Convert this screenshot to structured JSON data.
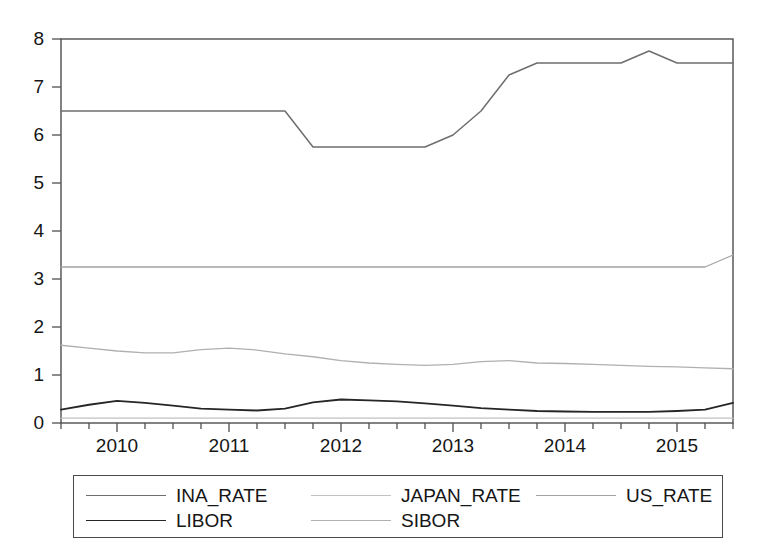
{
  "chart_data": {
    "type": "line",
    "title": "",
    "xlabel": "",
    "ylabel": "",
    "ylim": [
      0,
      8
    ],
    "yticks": [
      0,
      1,
      2,
      3,
      4,
      5,
      6,
      7,
      8
    ],
    "xticks": [
      "2010",
      "2011",
      "2012",
      "2013",
      "2014",
      "2015"
    ],
    "x_minor_ticks_per_year": 4,
    "grid": false,
    "legend_position": "bottom",
    "x_range_start": 2009.5,
    "x_range_end": 2015.5,
    "x": [
      2009.5,
      2009.75,
      2010.0,
      2010.25,
      2010.5,
      2010.75,
      2011.0,
      2011.25,
      2011.5,
      2011.75,
      2012.0,
      2012.25,
      2012.5,
      2012.75,
      2013.0,
      2013.25,
      2013.5,
      2013.75,
      2014.0,
      2014.25,
      2014.5,
      2014.75,
      2015.0,
      2015.25,
      2015.5
    ],
    "series": [
      {
        "name": "INA_RATE",
        "color": "#6e6e6e",
        "width": 1.5,
        "values": [
          6.5,
          6.5,
          6.5,
          6.5,
          6.5,
          6.5,
          6.5,
          6.5,
          6.5,
          5.75,
          5.75,
          5.75,
          5.75,
          5.75,
          6.0,
          6.5,
          7.25,
          7.5,
          7.5,
          7.5,
          7.5,
          7.75,
          7.5,
          7.5,
          7.5
        ]
      },
      {
        "name": "JAPAN_RATE",
        "color": "#c2c2c2",
        "width": 1.2,
        "values": [
          0.1,
          0.1,
          0.1,
          0.1,
          0.1,
          0.1,
          0.1,
          0.1,
          0.1,
          0.1,
          0.1,
          0.1,
          0.1,
          0.1,
          0.1,
          0.1,
          0.1,
          0.1,
          0.1,
          0.1,
          0.1,
          0.1,
          0.1,
          0.1,
          0.1
        ]
      },
      {
        "name": "US_RATE",
        "color": "#a3a3a3",
        "width": 1.3,
        "values": [
          3.25,
          3.25,
          3.25,
          3.25,
          3.25,
          3.25,
          3.25,
          3.25,
          3.25,
          3.25,
          3.25,
          3.25,
          3.25,
          3.25,
          3.25,
          3.25,
          3.25,
          3.25,
          3.25,
          3.25,
          3.25,
          3.25,
          3.25,
          3.25,
          3.5
        ]
      },
      {
        "name": "LIBOR",
        "color": "#262626",
        "width": 1.8,
        "values": [
          0.28,
          0.38,
          0.46,
          0.42,
          0.36,
          0.3,
          0.28,
          0.26,
          0.3,
          0.43,
          0.49,
          0.47,
          0.45,
          0.41,
          0.36,
          0.31,
          0.28,
          0.25,
          0.24,
          0.23,
          0.23,
          0.23,
          0.25,
          0.28,
          0.42
        ]
      },
      {
        "name": "SIBOR",
        "color": "#b0b0b0",
        "width": 1.3,
        "values": [
          1.62,
          1.56,
          1.5,
          1.46,
          1.46,
          1.53,
          1.56,
          1.52,
          1.44,
          1.38,
          1.3,
          1.25,
          1.22,
          1.2,
          1.22,
          1.28,
          1.3,
          1.25,
          1.24,
          1.22,
          1.2,
          1.18,
          1.17,
          1.15,
          1.13
        ]
      }
    ]
  },
  "legend": {
    "entries": [
      {
        "label": "INA_RATE"
      },
      {
        "label": "JAPAN_RATE"
      },
      {
        "label": "US_RATE"
      },
      {
        "label": "LIBOR"
      },
      {
        "label": "SIBOR"
      }
    ]
  },
  "axes": {
    "y_tick_labels": [
      "8",
      "7",
      "6",
      "5",
      "4",
      "3",
      "2",
      "1",
      "0"
    ],
    "x_tick_labels": [
      "2010",
      "2011",
      "2012",
      "2013",
      "2014",
      "2015"
    ]
  }
}
